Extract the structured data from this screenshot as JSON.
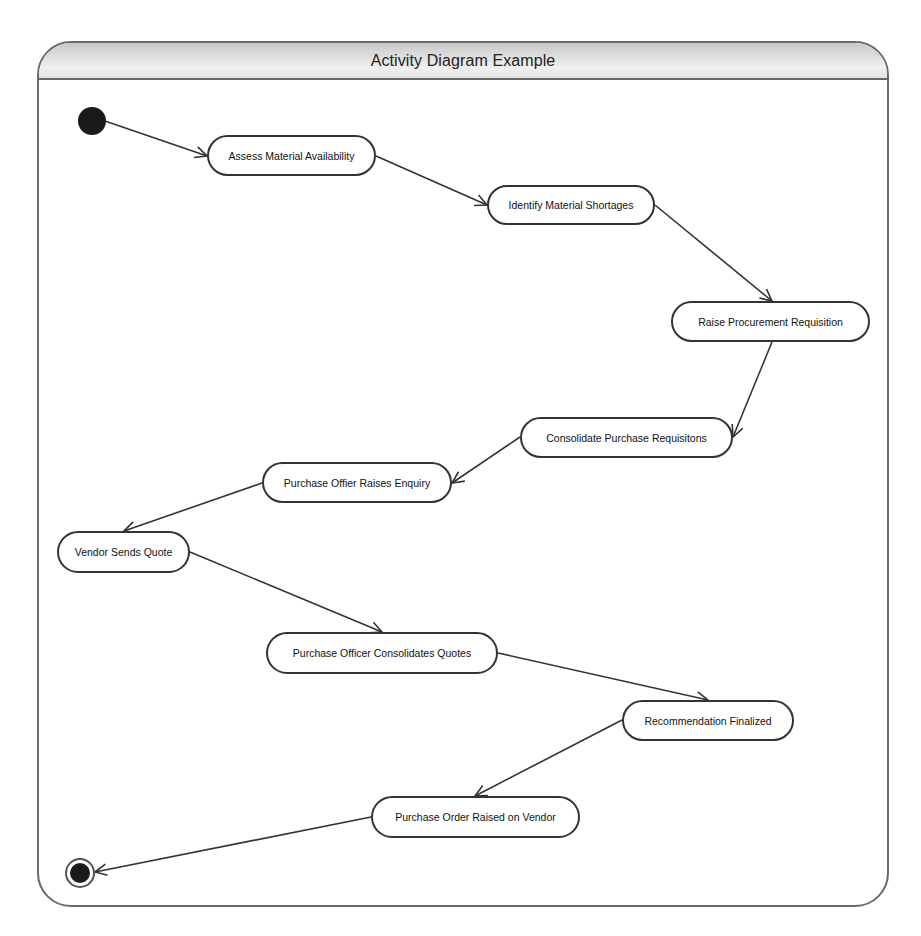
{
  "diagram": {
    "title": "Activity Diagram Example",
    "type": "UML activity diagram",
    "start_node": {
      "id": "start",
      "kind": "initial",
      "cx": 92,
      "cy": 121,
      "r": 14
    },
    "end_node": {
      "id": "end",
      "kind": "final",
      "cx": 80,
      "cy": 873,
      "r": 14
    },
    "activities": [
      {
        "id": "a1",
        "label": "Assess Material Availability",
        "x": 207,
        "y": 135,
        "w": 169,
        "h": 41
      },
      {
        "id": "a2",
        "label": "Identify Material Shortages",
        "x": 487,
        "y": 185,
        "w": 168,
        "h": 40
      },
      {
        "id": "a3",
        "label": "Raise Procurement Requisition",
        "x": 671,
        "y": 301,
        "w": 199,
        "h": 41
      },
      {
        "id": "a4",
        "label": "Consolidate Purchase Requisitons",
        "x": 520,
        "y": 417,
        "w": 213,
        "h": 41
      },
      {
        "id": "a5",
        "label": "Purchase Offier Raises Enquiry",
        "x": 262,
        "y": 462,
        "w": 190,
        "h": 41
      },
      {
        "id": "a6",
        "label": "Vendor Sends Quote",
        "x": 57,
        "y": 531,
        "w": 133,
        "h": 42
      },
      {
        "id": "a7",
        "label": "Purchase Officer Consolidates Quotes",
        "x": 266,
        "y": 632,
        "w": 232,
        "h": 42
      },
      {
        "id": "a8",
        "label": "Recommendation Finalized",
        "x": 622,
        "y": 700,
        "w": 172,
        "h": 41
      },
      {
        "id": "a9",
        "label": "Purchase Order Raised on Vendor",
        "x": 371,
        "y": 796,
        "w": 209,
        "h": 42
      }
    ],
    "flows": [
      {
        "from": "start",
        "to": "a1",
        "x1": 105,
        "y1": 121,
        "x2": 207,
        "y2": 156
      },
      {
        "from": "a1",
        "to": "a2",
        "x1": 376,
        "y1": 156,
        "x2": 487,
        "y2": 205
      },
      {
        "from": "a2",
        "to": "a3",
        "x1": 655,
        "y1": 205,
        "x2": 772,
        "y2": 301
      },
      {
        "from": "a3",
        "to": "a4",
        "x1": 772,
        "y1": 342,
        "x2": 733,
        "y2": 437
      },
      {
        "from": "a4",
        "to": "a5",
        "x1": 520,
        "y1": 437,
        "x2": 452,
        "y2": 483
      },
      {
        "from": "a5",
        "to": "a6",
        "x1": 262,
        "y1": 483,
        "x2": 124,
        "y2": 531
      },
      {
        "from": "a6",
        "to": "a7",
        "x1": 190,
        "y1": 552,
        "x2": 382,
        "y2": 632
      },
      {
        "from": "a7",
        "to": "a8",
        "x1": 498,
        "y1": 653,
        "x2": 708,
        "y2": 700
      },
      {
        "from": "a8",
        "to": "a9",
        "x1": 622,
        "y1": 720,
        "x2": 475,
        "y2": 796
      },
      {
        "from": "a9",
        "to": "end",
        "x1": 371,
        "y1": 817,
        "x2": 95,
        "y2": 872
      }
    ],
    "colors": {
      "frame_border": "#6a6a6a",
      "node_border": "#333333",
      "line": "#333333",
      "start_fill": "#1a1a1a",
      "title_bar_top": "#c8c8c8",
      "title_bar_bottom": "#e4e4e4"
    }
  }
}
